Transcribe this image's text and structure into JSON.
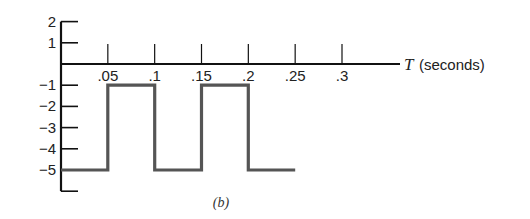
{
  "chart_data": {
    "type": "line",
    "subtype": "step",
    "title": "",
    "caption": "(b)",
    "xlabel_var": "T",
    "xlabel_unit": "(seconds)",
    "ylabel": "",
    "x_ticks": [
      ".05",
      ".1",
      ".15",
      ".2",
      ".25",
      ".3"
    ],
    "x_tick_values": [
      0.05,
      0.1,
      0.15,
      0.2,
      0.25,
      0.3
    ],
    "y_ticks": [
      "2",
      "1",
      "−1",
      "−2",
      "−3",
      "−4",
      "−5"
    ],
    "y_tick_values": [
      2,
      1,
      -1,
      -2,
      -3,
      -4,
      -5
    ],
    "xlim": [
      0,
      0.35
    ],
    "ylim": [
      -6,
      2
    ],
    "grid": false,
    "legend": null,
    "series": [
      {
        "name": "square wave",
        "color": "#555555",
        "points": [
          [
            0,
            -5
          ],
          [
            0.05,
            -5
          ],
          [
            0.05,
            -1
          ],
          [
            0.1,
            -1
          ],
          [
            0.1,
            -5
          ],
          [
            0.15,
            -5
          ],
          [
            0.15,
            -1
          ],
          [
            0.2,
            -1
          ],
          [
            0.2,
            -5
          ],
          [
            0.25,
            -5
          ]
        ]
      }
    ]
  },
  "colors": {
    "axis": "#111111",
    "trace": "#555555",
    "background": "#ffffff"
  }
}
